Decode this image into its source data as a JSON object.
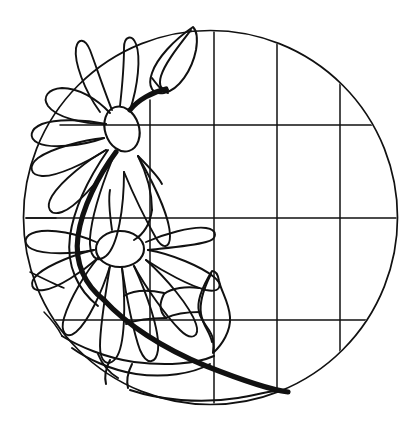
{
  "artwork": {
    "title": "Stained Glass Floral Roundel Pattern",
    "description": "Black line-art stained glass pattern: a circular panel with a rectangular lead grid on the right and two daisy-like flowers with leaves and a curving stem on the left.",
    "style": "line-art",
    "background_color": "#ffffff",
    "line_color": "#111111",
    "canvas": {
      "width": 420,
      "height": 436
    }
  },
  "geometry": {
    "circle": {
      "cx": 210.5,
      "cy": 217.5,
      "r": 187.5
    },
    "grid": {
      "vertical_x": [
        150,
        214,
        277,
        340
      ],
      "horizontal_y": [
        125,
        218,
        320
      ],
      "note": "lead-came grid clipped to the circle"
    },
    "flowers": [
      {
        "name": "upper-flower",
        "center_x": 122,
        "center_y": 129,
        "core_rx": 17,
        "core_ry": 23,
        "petal_count": 8
      },
      {
        "name": "lower-flower",
        "center_x": 120,
        "center_y": 249,
        "core_rx": 24,
        "core_ry": 18,
        "petal_count": 9
      }
    ],
    "bud": {
      "name": "top-bud",
      "tip_x": 192,
      "tip_y": 27,
      "base_x": 168,
      "base_y": 90
    },
    "center_leaf": {
      "name": "center-leaf",
      "top_x": 212,
      "top_y": 272,
      "bottom_x": 214,
      "bottom_y": 352
    }
  },
  "paths": {
    "circle_frame": "M 210.5 30 A 187.5 187.5 0 1 1 210.4 30",
    "grid_v1": "M 150 104 L 150 334",
    "grid_v2": "M 214 30 L 214 404",
    "grid_v3": "M 277 38 L 277 400",
    "grid_v4": "M 340 83 L 340 356",
    "grid_h1": "M 70 125 L 385 125",
    "grid_h2": "M 36 218 L 398 218",
    "grid_h3": "M 62 320 L 372 320",
    "bud_outer": "M 192 27 C 176 42 160 60 158 76 C 156 88 164 93 172 90 C 184 85 194 66 196 48 C 197 36 195 30 192 27 Z",
    "bud_inner": "M 190 32 C 180 46 170 62 168 76 C 167 85 172 88 176 85",
    "stem_main": "M 168 88 C 150 96 136 106 126 118",
    "stem_long": "M 116 152 C 90 190 72 236 78 268 C 84 300 110 326 150 348 C 200 374 252 392 286 394",
    "center_leaf": "M 212 272 C 205 286 198 300 200 312 C 202 324 212 330 214 340 C 215 348 214 352 214 352 C 222 344 230 332 230 318 C 230 304 222 292 220 282 C 219 276 216 272 212 272 Z"
  }
}
